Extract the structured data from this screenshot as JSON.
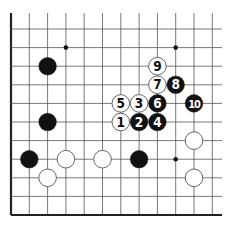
{
  "board": {
    "title": "Go board diagram (partial, bottom-left corner)",
    "origin_x": 11,
    "origin_y": 29,
    "spacing_x": 18.3,
    "spacing_y": 18.6,
    "cols": 12,
    "rows": 11,
    "line_top_y": 13,
    "line_right_x": 222,
    "left_edge": true,
    "bottom_edge": true,
    "colors": {
      "line": "#555555",
      "edge": "#222222",
      "black_stone": "#111111",
      "white_stone": "#ffffff",
      "white_stroke": "#555555"
    }
  },
  "star_points": [
    {
      "col": 3,
      "row": 1
    },
    {
      "col": 9,
      "row": 1
    },
    {
      "col": 9,
      "row": 7
    }
  ],
  "stones": [
    {
      "color": "black",
      "col": 2,
      "row": 2,
      "label": ""
    },
    {
      "color": "black",
      "col": 2,
      "row": 5,
      "label": ""
    },
    {
      "color": "black",
      "col": 1,
      "row": 7,
      "label": ""
    },
    {
      "color": "white",
      "col": 3,
      "row": 7,
      "label": ""
    },
    {
      "color": "white",
      "col": 5,
      "row": 7,
      "label": ""
    },
    {
      "color": "black",
      "col": 7,
      "row": 7,
      "label": ""
    },
    {
      "color": "white",
      "col": 2,
      "row": 8,
      "label": ""
    },
    {
      "color": "white",
      "col": 10,
      "row": 6,
      "label": ""
    },
    {
      "color": "white",
      "col": 10,
      "row": 8,
      "label": ""
    },
    {
      "color": "white",
      "col": 6,
      "row": 5,
      "label": "1"
    },
    {
      "color": "black",
      "col": 7,
      "row": 5,
      "label": "2"
    },
    {
      "color": "white",
      "col": 7,
      "row": 4,
      "label": "3"
    },
    {
      "color": "black",
      "col": 8,
      "row": 5,
      "label": "4"
    },
    {
      "color": "white",
      "col": 6,
      "row": 4,
      "label": "5"
    },
    {
      "color": "black",
      "col": 8,
      "row": 4,
      "label": "6"
    },
    {
      "color": "white",
      "col": 8,
      "row": 3,
      "label": "7"
    },
    {
      "color": "black",
      "col": 9,
      "row": 3,
      "label": "8"
    },
    {
      "color": "white",
      "col": 8,
      "row": 2,
      "label": "9"
    },
    {
      "color": "black",
      "col": 10,
      "row": 4,
      "label": "10"
    }
  ]
}
